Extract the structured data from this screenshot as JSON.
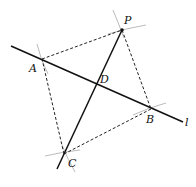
{
  "diagram": {
    "labels": {
      "P": "P",
      "A": "A",
      "B": "B",
      "C": "C",
      "D": "D",
      "l": "l"
    },
    "line_style": {
      "main": "#111111",
      "dashed": "#222222",
      "arcs": "#aaaaaa"
    }
  }
}
